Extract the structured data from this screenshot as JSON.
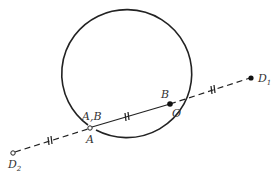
{
  "diagram": {
    "colors": {
      "stroke": "#222222",
      "background": "#ffffff",
      "label": "#333333"
    },
    "circle": {
      "cx": 117,
      "cy": 69,
      "rx": 65,
      "ry": 64
    },
    "points": {
      "A": {
        "x": 90,
        "y": 128,
        "style": "open"
      },
      "O": {
        "x": 170,
        "y": 104,
        "style": "filled"
      },
      "D1": {
        "x": 251,
        "y": 78,
        "style": "filled"
      },
      "D2": {
        "x": 13,
        "y": 153,
        "style": "open"
      }
    },
    "labels": {
      "A_B": "A,B",
      "A": "A",
      "B": "B",
      "O": "O",
      "D1_main": "D",
      "D1_sub": "1",
      "D2_main": "D",
      "D2_sub": "2"
    },
    "tick_marks": "equal-length marks (//) on D2–A, A–O, O–D1 segments"
  }
}
